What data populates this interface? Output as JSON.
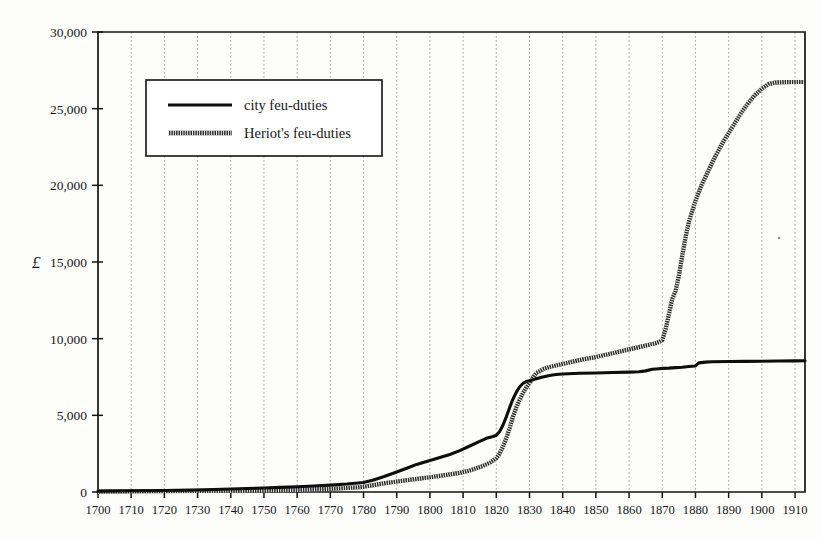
{
  "chart_data": {
    "type": "line",
    "title": "",
    "subtitle": "",
    "xlabel": "",
    "ylabel": "£",
    "xlim": [
      1700,
      1913
    ],
    "ylim": [
      0,
      30000
    ],
    "grid": "vertical dotted gridlines at each decade",
    "legend_position": "upper-left inside plot",
    "xticks": [
      1700,
      1710,
      1720,
      1730,
      1740,
      1750,
      1760,
      1770,
      1780,
      1790,
      1800,
      1810,
      1820,
      1830,
      1840,
      1850,
      1860,
      1870,
      1880,
      1890,
      1900,
      1910
    ],
    "xtick_labels": [
      "1700",
      "1710",
      "1720",
      "1730",
      "1740",
      "1750",
      "1760",
      "1770",
      "1780",
      "1790",
      "1800",
      "1810",
      "1820",
      "1830",
      "1840",
      "1850",
      "1860",
      "1870",
      "1880",
      "1890",
      "1900",
      "1910"
    ],
    "yticks": [
      0,
      5000,
      10000,
      15000,
      20000,
      25000,
      30000
    ],
    "ytick_labels": [
      "0",
      "5,000",
      "10,000",
      "15,000",
      "20,000",
      "25,000",
      "30,000"
    ],
    "series": [
      {
        "name": "city feu-duties",
        "style": "solid-black",
        "x": [
          1700,
          1710,
          1720,
          1730,
          1735,
          1740,
          1745,
          1750,
          1755,
          1760,
          1765,
          1770,
          1775,
          1780,
          1783,
          1786,
          1790,
          1793,
          1796,
          1800,
          1803,
          1806,
          1809,
          1812,
          1815,
          1817,
          1819,
          1820,
          1821,
          1822,
          1823,
          1824,
          1825,
          1826,
          1827,
          1828,
          1829,
          1830,
          1832,
          1834,
          1836,
          1838,
          1840,
          1845,
          1850,
          1855,
          1860,
          1863,
          1865,
          1867,
          1869,
          1870,
          1872,
          1874,
          1876,
          1878,
          1880,
          1881,
          1883,
          1885,
          1890,
          1895,
          1900,
          1905,
          1910,
          1913
        ],
        "y": [
          60,
          80,
          100,
          130,
          160,
          200,
          230,
          260,
          300,
          340,
          390,
          450,
          520,
          620,
          780,
          1000,
          1300,
          1550,
          1800,
          2050,
          2250,
          2450,
          2700,
          3000,
          3300,
          3500,
          3620,
          3700,
          3950,
          4350,
          4900,
          5500,
          6050,
          6500,
          6850,
          7080,
          7200,
          7260,
          7380,
          7500,
          7600,
          7660,
          7700,
          7740,
          7760,
          7790,
          7820,
          7840,
          7900,
          8000,
          8040,
          8060,
          8080,
          8110,
          8140,
          8180,
          8220,
          8420,
          8470,
          8490,
          8510,
          8520,
          8530,
          8540,
          8550,
          8560
        ]
      },
      {
        "name": "Heriot's feu-duties",
        "style": "hatched-band",
        "x": [
          1700,
          1710,
          1720,
          1730,
          1740,
          1750,
          1760,
          1765,
          1770,
          1775,
          1778,
          1780,
          1783,
          1786,
          1789,
          1792,
          1795,
          1798,
          1800,
          1803,
          1806,
          1809,
          1812,
          1814,
          1816,
          1818,
          1820,
          1821,
          1822,
          1823,
          1824,
          1825,
          1826,
          1827,
          1828,
          1829,
          1830,
          1831,
          1832,
          1834,
          1836,
          1838,
          1840,
          1843,
          1846,
          1850,
          1853,
          1856,
          1859,
          1862,
          1864,
          1866,
          1868,
          1869,
          1870,
          1871,
          1872,
          1873,
          1874,
          1875,
          1876,
          1877,
          1878,
          1880,
          1882,
          1884,
          1886,
          1888,
          1890,
          1892,
          1894,
          1896,
          1898,
          1900,
          1902,
          1904,
          1905,
          1907,
          1910,
          1913
        ],
        "y": [
          30,
          40,
          55,
          70,
          90,
          110,
          140,
          170,
          210,
          260,
          300,
          340,
          450,
          560,
          650,
          740,
          820,
          900,
          960,
          1050,
          1150,
          1250,
          1400,
          1550,
          1700,
          1900,
          2200,
          2500,
          2950,
          3500,
          4150,
          4900,
          5500,
          6000,
          6450,
          6800,
          7100,
          7450,
          7750,
          8000,
          8150,
          8250,
          8350,
          8500,
          8650,
          8800,
          8950,
          9100,
          9250,
          9400,
          9500,
          9600,
          9700,
          9780,
          9900,
          10600,
          11600,
          12600,
          13100,
          14100,
          15400,
          16600,
          17600,
          19000,
          20100,
          21000,
          21900,
          22700,
          23400,
          24100,
          24800,
          25400,
          25900,
          26300,
          26600,
          26700,
          26720,
          26730,
          26740,
          26740
        ]
      }
    ],
    "notes": {
      "crossover_year": 1833,
      "crossover_value": 7800,
      "city_final_value": 8560,
      "heriot_final_value": 26740
    }
  },
  "legend": {
    "entries": [
      {
        "label": "city feu-duties"
      },
      {
        "label": "Heriot's feu-duties"
      }
    ]
  },
  "axis": {
    "y_unit": "£"
  }
}
